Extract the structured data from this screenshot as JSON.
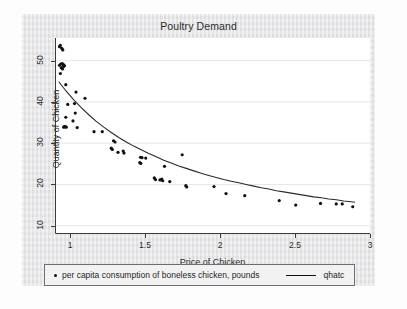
{
  "figure": {
    "title": "Poultry Demand",
    "background_color": "#e3e4e6",
    "plot_background_color": "#ffffff"
  },
  "legend": {
    "scatter_label": "per capita consumption of boneless chicken, pounds",
    "line_label": "qhatc",
    "marker_icon": "dot-marker-icon",
    "line_icon": "line-marker-icon"
  },
  "chart_data": {
    "type": "scatter",
    "title": "Poultry Demand",
    "xlabel": "Price of Chicken",
    "ylabel": "Quantity of Chicken",
    "xlim": [
      0.9,
      3.0
    ],
    "ylim": [
      8.0,
      55.5
    ],
    "xticks": [
      1,
      1.5,
      2,
      2.5,
      3
    ],
    "xticklabels": [
      "1",
      "1.5",
      "2",
      "2.5",
      "3"
    ],
    "yticks": [
      10,
      20,
      30,
      40,
      50
    ],
    "yticklabels": [
      "10",
      "20",
      "30",
      "40",
      "50"
    ],
    "grid": "horizontal",
    "grid_color": "#e6e6e6",
    "marker_color": "#101010",
    "line_color": "#2a2a2a",
    "series": [
      {
        "name": "per capita consumption of boneless chicken, pounds",
        "type": "scatter",
        "points": [
          [
            0.93,
            53.4
          ],
          [
            0.945,
            53.0
          ],
          [
            0.952,
            52.6
          ],
          [
            0.935,
            53.7
          ],
          [
            0.93,
            48.9
          ],
          [
            0.938,
            49.2
          ],
          [
            0.948,
            49.3
          ],
          [
            0.955,
            49.1
          ],
          [
            0.942,
            48.3
          ],
          [
            0.95,
            48.0
          ],
          [
            0.958,
            48.6
          ],
          [
            0.963,
            48.8
          ],
          [
            0.936,
            46.9
          ],
          [
            0.972,
            44.2
          ],
          [
            1.04,
            42.4
          ],
          [
            1.1,
            40.9
          ],
          [
            0.985,
            39.4
          ],
          [
            1.03,
            39.6
          ],
          [
            1.035,
            37.3
          ],
          [
            0.972,
            36.3
          ],
          [
            1.02,
            35.4
          ],
          [
            0.962,
            34.0
          ],
          [
            0.968,
            34.0
          ],
          [
            0.975,
            33.9
          ],
          [
            0.958,
            33.9
          ],
          [
            1.048,
            33.8
          ],
          [
            1.16,
            32.8
          ],
          [
            1.215,
            32.8
          ],
          [
            1.29,
            30.6
          ],
          [
            1.3,
            30.3
          ],
          [
            1.275,
            28.8
          ],
          [
            1.282,
            28.5
          ],
          [
            1.32,
            27.8
          ],
          [
            1.355,
            28.1
          ],
          [
            1.36,
            27.6
          ],
          [
            1.47,
            26.6
          ],
          [
            1.48,
            26.5
          ],
          [
            1.505,
            26.4
          ],
          [
            1.465,
            25.3
          ],
          [
            1.472,
            25.1
          ],
          [
            1.63,
            24.4
          ],
          [
            1.748,
            27.2
          ],
          [
            1.562,
            21.6
          ],
          [
            1.57,
            21.2
          ],
          [
            1.6,
            21.1
          ],
          [
            1.612,
            21.3
          ],
          [
            1.618,
            20.9
          ],
          [
            1.665,
            20.7
          ],
          [
            1.772,
            19.7
          ],
          [
            1.778,
            19.4
          ],
          [
            1.96,
            19.5
          ],
          [
            2.04,
            17.8
          ],
          [
            2.165,
            17.3
          ],
          [
            2.395,
            16.1
          ],
          [
            2.505,
            15.0
          ],
          [
            2.67,
            15.4
          ],
          [
            2.775,
            15.3
          ],
          [
            2.815,
            15.3
          ],
          [
            2.885,
            14.6
          ]
        ]
      },
      {
        "name": "qhatc",
        "type": "line",
        "points": [
          [
            0.925,
            44.9
          ],
          [
            0.975,
            42.6
          ],
          [
            1.025,
            40.5
          ],
          [
            1.075,
            38.6
          ],
          [
            1.125,
            36.9
          ],
          [
            1.175,
            35.3
          ],
          [
            1.225,
            33.9
          ],
          [
            1.275,
            32.6
          ],
          [
            1.325,
            31.4
          ],
          [
            1.375,
            30.3
          ],
          [
            1.425,
            29.3
          ],
          [
            1.475,
            28.4
          ],
          [
            1.525,
            27.5
          ],
          [
            1.575,
            26.7
          ],
          [
            1.625,
            25.9
          ],
          [
            1.675,
            25.2
          ],
          [
            1.725,
            24.5
          ],
          [
            1.775,
            23.9
          ],
          [
            1.825,
            23.3
          ],
          [
            1.875,
            22.7
          ],
          [
            1.925,
            22.2
          ],
          [
            1.975,
            21.7
          ],
          [
            2.025,
            21.2
          ],
          [
            2.075,
            20.8
          ],
          [
            2.125,
            20.4
          ],
          [
            2.175,
            20.0
          ],
          [
            2.225,
            19.6
          ],
          [
            2.275,
            19.2
          ],
          [
            2.325,
            18.9
          ],
          [
            2.375,
            18.5
          ],
          [
            2.425,
            18.2
          ],
          [
            2.475,
            17.9
          ],
          [
            2.525,
            17.6
          ],
          [
            2.575,
            17.3
          ],
          [
            2.625,
            17.0
          ],
          [
            2.675,
            16.8
          ],
          [
            2.725,
            16.5
          ],
          [
            2.775,
            16.3
          ],
          [
            2.825,
            16.0
          ],
          [
            2.875,
            15.8
          ],
          [
            2.9,
            15.7
          ]
        ]
      }
    ]
  }
}
